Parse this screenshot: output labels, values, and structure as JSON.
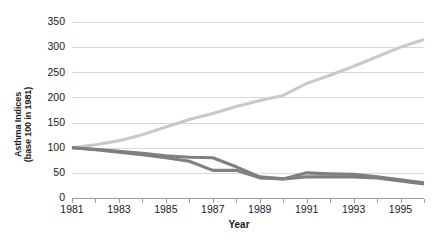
{
  "chart_data": {
    "type": "line",
    "title": "",
    "xlabel": "Year",
    "ylabel": "Asthma Indices (base 100 in 1981)",
    "ylabel_line1": "Asthma Indices",
    "ylabel_line2": "(base 100 in 1981)",
    "grid": true,
    "legend_position": "none",
    "xlim": [
      1981,
      1996
    ],
    "ylim": [
      0,
      350
    ],
    "y_ticks": [
      0,
      50,
      100,
      150,
      200,
      250,
      300,
      350
    ],
    "y_tick_labels": [
      "0",
      "50",
      "100",
      "150",
      "200",
      "250",
      "300",
      "350"
    ],
    "x_ticks": [
      1981,
      1982,
      1983,
      1984,
      1985,
      1986,
      1987,
      1988,
      1989,
      1990,
      1991,
      1992,
      1993,
      1994,
      1995,
      1996
    ],
    "x_tick_labels": [
      "1981",
      "",
      "1983",
      "",
      "1985",
      "",
      "1987",
      "",
      "1989",
      "",
      "1991",
      "",
      "1993",
      "",
      "1995",
      ""
    ],
    "x": [
      1981,
      1982,
      1983,
      1984,
      1985,
      1986,
      1987,
      1988,
      1989,
      1990,
      1991,
      1992,
      1993,
      1994,
      1995,
      1996
    ],
    "series": [
      {
        "name": "rising-index",
        "color": "#c9c9c9",
        "values": [
          100,
          106,
          114,
          126,
          141,
          156,
          168,
          182,
          194,
          204,
          228,
          244,
          262,
          281,
          300,
          315
        ]
      },
      {
        "name": "declining-index-a",
        "color": "#7f7f7f",
        "values": [
          100,
          96,
          91,
          86,
          80,
          73,
          55,
          55,
          40,
          38,
          42,
          42,
          42,
          40,
          34,
          28
        ]
      },
      {
        "name": "declining-index-b",
        "color": "#7f7f7f",
        "values": [
          100,
          97,
          93,
          89,
          84,
          81,
          80,
          62,
          42,
          38,
          50,
          48,
          47,
          42,
          36,
          30
        ]
      }
    ]
  },
  "colors": {
    "background": "#ffffff",
    "gridline": "#d9d9d9",
    "axis": "#9a9a9a",
    "text": "#1a1a1a",
    "series_light": "#c9c9c9",
    "series_dark": "#7f7f7f"
  }
}
